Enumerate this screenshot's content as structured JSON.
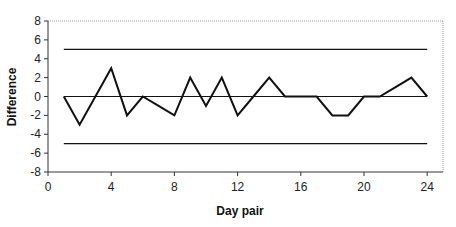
{
  "chart_data": {
    "type": "line",
    "title": "",
    "xlabel": "Day pair",
    "ylabel": "Difference",
    "xlim": [
      0,
      25
    ],
    "ylim": [
      -8,
      8
    ],
    "x_ticks": [
      0,
      4,
      8,
      12,
      16,
      20,
      24
    ],
    "y_ticks": [
      8,
      6,
      4,
      2,
      0,
      -2,
      -4,
      -6,
      -8
    ],
    "grid": false,
    "legend": null,
    "series": [
      {
        "name": "Difference",
        "x": [
          1,
          2,
          3,
          4,
          5,
          6,
          7,
          8,
          9,
          10,
          11,
          12,
          13,
          14,
          15,
          16,
          17,
          18,
          19,
          20,
          21,
          22,
          23,
          24
        ],
        "values": [
          0,
          -3,
          0,
          3,
          -2,
          0,
          -1,
          -2,
          2,
          -1,
          2,
          -2,
          0,
          2,
          0,
          0,
          0,
          -2,
          -2,
          0,
          0,
          1,
          2,
          0
        ]
      }
    ],
    "reference_lines": [
      {
        "name": "upper-limit",
        "y": 5,
        "x_start": 1,
        "x_end": 24
      },
      {
        "name": "mean-line",
        "y": 0,
        "x_start": 1,
        "x_end": 24
      },
      {
        "name": "lower-limit",
        "y": -5,
        "x_start": 1,
        "x_end": 24
      }
    ]
  },
  "colors": {
    "line": "#111111",
    "axis": "#333333",
    "frame": "#9a9a9a"
  }
}
